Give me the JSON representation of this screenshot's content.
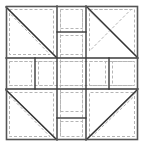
{
  "diagram": {
    "type": "quilt-block",
    "canvas": {
      "width": 145,
      "height": 149
    },
    "colors": {
      "background": "#ffffff",
      "piece_fill": "#ffffff",
      "seam_line": "#3a3a3a",
      "outer_frame": "#555555",
      "dashed_seam_allowance": "#b5b5b5",
      "diagonal_line": "#333333",
      "diagonal_shadow": "#c9c9c9"
    },
    "grid": {
      "x_divisions": [
        6,
        57,
        86,
        138
      ],
      "y_divisions": [
        6,
        58,
        89,
        140
      ],
      "description": "Nine-patch arrangement: four corner half-square triangle units, four edge rectangle units, one center square unit."
    },
    "units": [
      {
        "name": "top-left-corner-unit",
        "kind": "half-square-triangle",
        "diagonal": "top-left-to-bottom-right",
        "bounds": [
          6,
          6,
          57,
          58
        ]
      },
      {
        "name": "top-center-unit",
        "kind": "divided-rectangle",
        "split": "horizontal",
        "split_at": 32,
        "bounds": [
          57,
          6,
          86,
          58
        ]
      },
      {
        "name": "top-right-corner-unit",
        "kind": "half-square-triangle",
        "diagonal": "top-left-to-bottom-right",
        "bounds": [
          86,
          6,
          138,
          58
        ]
      },
      {
        "name": "middle-left-unit",
        "kind": "divided-rectangle",
        "split": "vertical",
        "split_at": 35,
        "bounds": [
          6,
          58,
          57,
          89
        ]
      },
      {
        "name": "center-square-unit",
        "kind": "square",
        "bounds": [
          57,
          58,
          86,
          89
        ]
      },
      {
        "name": "middle-right-unit",
        "kind": "divided-rectangle",
        "split": "vertical",
        "split_at": 109,
        "bounds": [
          86,
          58,
          138,
          89
        ]
      },
      {
        "name": "bottom-left-corner-unit",
        "kind": "half-square-triangle",
        "diagonal": "top-left-to-bottom-right",
        "bounds": [
          6,
          89,
          57,
          140
        ]
      },
      {
        "name": "bottom-center-unit",
        "kind": "divided-rectangle",
        "split": "horizontal",
        "split_at": 118,
        "bounds": [
          57,
          89,
          86,
          140
        ]
      },
      {
        "name": "bottom-right-corner-unit",
        "kind": "half-square-triangle",
        "diagonal": "bottom-left-to-top-right",
        "bounds": [
          86,
          89,
          138,
          140
        ]
      }
    ],
    "seam_allowance": {
      "inset": 3,
      "dash_pattern": "3 2",
      "stroke_width": 1
    },
    "stroke_widths": {
      "outer_frame": 1.6,
      "seam_line": 1.4,
      "diagonal": 1.4,
      "dashed": 1
    }
  }
}
